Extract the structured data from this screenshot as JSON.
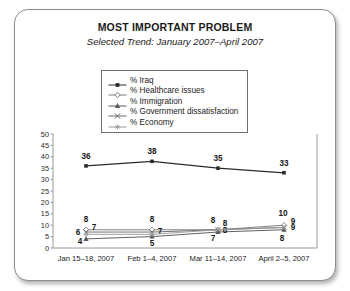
{
  "chart_data": {
    "type": "line",
    "title": "MOST IMPORTANT PROBLEM",
    "subtitle": "Selected Trend: January 2007–April 2007",
    "xlabel": "",
    "ylabel": "",
    "ylim": [
      0,
      50
    ],
    "yticks": [
      "0",
      "5",
      "10",
      "15",
      "20",
      "25",
      "30",
      "35",
      "40",
      "45",
      "50"
    ],
    "grid": false,
    "legend_position": "top-center",
    "categories": [
      "Jan 15–18, 2007",
      "Feb 1–4, 2007",
      "Mar 11–14, 2007",
      "April 2–5, 2007"
    ],
    "series": [
      {
        "name": "% Iraq",
        "marker": "filled-square",
        "color": "#2b2b2b",
        "values": [
          36,
          38,
          35,
          33
        ],
        "labels": [
          "36",
          "38",
          "35",
          "33"
        ]
      },
      {
        "name": "% Healthcare issues",
        "marker": "open-diamond",
        "color": "#7a7a7a",
        "values": [
          8,
          8,
          8,
          10
        ],
        "labels": [
          "8",
          "8",
          "8",
          "10"
        ]
      },
      {
        "name": "% Immigration",
        "marker": "filled-triangle",
        "color": "#5a5a5a",
        "values": [
          4,
          5,
          7,
          8
        ],
        "labels": [
          "4",
          "5",
          "7",
          "8"
        ]
      },
      {
        "name": "% Government dissatisfaction",
        "marker": "x-cross",
        "color": "#6a6a6a",
        "values": [
          7,
          7,
          8,
          9
        ],
        "labels": [
          "7",
          "7",
          "8",
          "9"
        ]
      },
      {
        "name": "% Economy",
        "marker": "asterisk",
        "color": "#9a9a9a",
        "values": [
          6,
          6,
          8,
          9
        ],
        "labels": [
          "6",
          "",
          "8",
          "9"
        ]
      }
    ]
  }
}
